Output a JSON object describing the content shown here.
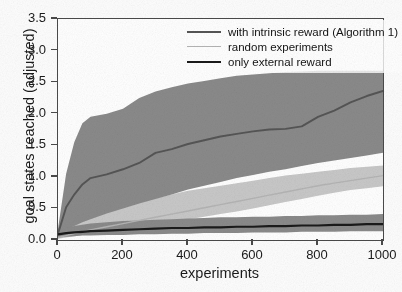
{
  "chart_data": {
    "type": "line",
    "title": "",
    "xlabel": "experiments",
    "ylabel": "goal states reached (adjusted)",
    "xlim": [
      0,
      1000
    ],
    "ylim": [
      0.0,
      3.5
    ],
    "xticks": [
      0,
      200,
      400,
      600,
      800,
      1000
    ],
    "ytick_labels": [
      "0.0",
      "0.5",
      "1.0",
      "1.5",
      "2.0",
      "2.5",
      "3.0",
      "3.5"
    ],
    "yticks": [
      0.0,
      0.5,
      1.0,
      1.5,
      2.0,
      2.5,
      3.0,
      3.5
    ],
    "grid": false,
    "legend_position": "upper right",
    "x": [
      0,
      25,
      50,
      75,
      100,
      150,
      200,
      250,
      300,
      350,
      400,
      450,
      500,
      550,
      600,
      650,
      700,
      750,
      800,
      850,
      900,
      950,
      1000
    ],
    "series": [
      {
        "name": "with intrinsic reward (Algorithm 1)",
        "color": "#555555",
        "band_color": "#8a8a8a",
        "values": [
          0.1,
          0.52,
          0.72,
          0.88,
          0.98,
          1.04,
          1.12,
          1.22,
          1.38,
          1.44,
          1.52,
          1.58,
          1.64,
          1.68,
          1.72,
          1.75,
          1.76,
          1.8,
          1.95,
          2.05,
          2.18,
          2.28,
          2.36
        ],
        "band_upper": [
          0.18,
          1.05,
          1.55,
          1.85,
          1.95,
          2.0,
          2.08,
          2.25,
          2.35,
          2.42,
          2.48,
          2.52,
          2.56,
          2.6,
          2.62,
          2.64,
          2.66,
          2.67,
          2.68,
          2.68,
          2.68,
          2.68,
          2.68
        ],
        "band_lower": [
          0.05,
          0.16,
          0.22,
          0.28,
          0.33,
          0.42,
          0.5,
          0.58,
          0.65,
          0.72,
          0.8,
          0.86,
          0.92,
          0.98,
          1.03,
          1.08,
          1.12,
          1.17,
          1.22,
          1.26,
          1.3,
          1.34,
          1.38
        ]
      },
      {
        "name": "random experiments",
        "color": "#b4b4b4",
        "band_color": "#c8c8c8",
        "values": [
          0.04,
          0.07,
          0.1,
          0.13,
          0.16,
          0.21,
          0.26,
          0.31,
          0.36,
          0.41,
          0.46,
          0.51,
          0.56,
          0.61,
          0.66,
          0.71,
          0.76,
          0.81,
          0.86,
          0.9,
          0.94,
          0.98,
          1.02
        ],
        "band_upper": [
          0.08,
          0.17,
          0.24,
          0.3,
          0.36,
          0.44,
          0.52,
          0.6,
          0.66,
          0.72,
          0.78,
          0.82,
          0.86,
          0.9,
          0.94,
          0.98,
          1.02,
          1.05,
          1.08,
          1.11,
          1.14,
          1.16,
          1.18
        ],
        "band_lower": [
          0.02,
          0.04,
          0.06,
          0.08,
          0.1,
          0.13,
          0.17,
          0.21,
          0.25,
          0.29,
          0.33,
          0.37,
          0.41,
          0.45,
          0.5,
          0.55,
          0.6,
          0.65,
          0.7,
          0.75,
          0.79,
          0.82,
          0.85
        ]
      },
      {
        "name": "only external reward",
        "color": "#1a1a1a",
        "band_color": "#8a8a8a",
        "values": [
          0.09,
          0.11,
          0.12,
          0.13,
          0.14,
          0.15,
          0.16,
          0.17,
          0.18,
          0.19,
          0.19,
          0.2,
          0.2,
          0.21,
          0.21,
          0.22,
          0.22,
          0.23,
          0.23,
          0.24,
          0.24,
          0.25,
          0.25
        ],
        "band_upper": [
          0.14,
          0.19,
          0.22,
          0.24,
          0.26,
          0.28,
          0.3,
          0.31,
          0.32,
          0.33,
          0.34,
          0.35,
          0.36,
          0.36,
          0.37,
          0.37,
          0.38,
          0.38,
          0.39,
          0.39,
          0.4,
          0.4,
          0.41
        ],
        "band_lower": [
          0.04,
          0.05,
          0.06,
          0.07,
          0.07,
          0.08,
          0.08,
          0.09,
          0.09,
          0.1,
          0.1,
          0.11,
          0.11,
          0.11,
          0.12,
          0.12,
          0.12,
          0.13,
          0.13,
          0.13,
          0.14,
          0.14,
          0.14
        ]
      }
    ]
  },
  "axes": {
    "ylabel": "goal states reached (adjusted)",
    "xlabel": "experiments"
  },
  "legend": {
    "entries": [
      {
        "label": "with intrinsic reward (Algorithm 1)"
      },
      {
        "label": "random experiments"
      },
      {
        "label": "only external reward"
      }
    ]
  }
}
